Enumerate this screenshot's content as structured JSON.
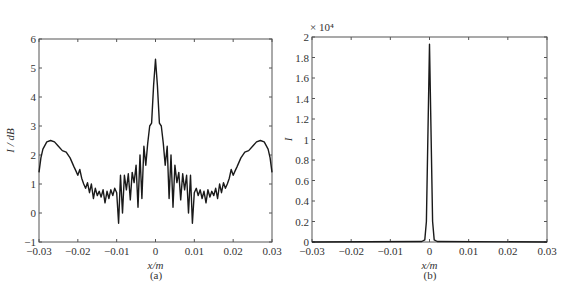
{
  "figure": {
    "caption_a": "(a)",
    "caption_b": "(b)"
  },
  "chart_data": [
    {
      "type": "line",
      "panel": "(a)",
      "xlabel": "x/m",
      "ylabel": "I / dB",
      "xlim": [
        -0.03,
        0.03
      ],
      "ylim": [
        -1,
        6
      ],
      "xticks": [
        -0.03,
        -0.02,
        -0.01,
        0,
        0.01,
        0.02,
        0.03
      ],
      "xtick_labels": [
        "−0.03",
        "−0.02",
        "−0.01",
        "0",
        "0.01",
        "0.02",
        "0.03"
      ],
      "yticks": [
        -1,
        0,
        1,
        2,
        3,
        4,
        5,
        6
      ],
      "ytick_labels": [
        "−1",
        "0",
        "1",
        "2",
        "3",
        "4",
        "5",
        "6"
      ],
      "grid": false,
      "symmetric": true,
      "series": [
        {
          "name": "I (dB)",
          "color": "#1a1a1a",
          "x": [
            -0.03,
            -0.0295,
            -0.029,
            -0.028,
            -0.027,
            -0.026,
            -0.025,
            -0.024,
            -0.023,
            -0.022,
            -0.021,
            -0.0205,
            -0.02,
            -0.0195,
            -0.019,
            -0.0185,
            -0.018,
            -0.0175,
            -0.017,
            -0.0165,
            -0.016,
            -0.0155,
            -0.015,
            -0.0145,
            -0.014,
            -0.0135,
            -0.013,
            -0.0125,
            -0.012,
            -0.0115,
            -0.011,
            -0.0105,
            -0.01,
            -0.0095,
            -0.009,
            -0.0085,
            -0.008,
            -0.0075,
            -0.007,
            -0.0065,
            -0.006,
            -0.0055,
            -0.005,
            -0.0045,
            -0.004,
            -0.0035,
            -0.003,
            -0.0025,
            -0.002,
            -0.0015,
            -0.001,
            -0.0005,
            0
          ],
          "y": [
            1.4,
            1.9,
            2.2,
            2.45,
            2.5,
            2.45,
            2.3,
            2.15,
            2.1,
            1.9,
            1.6,
            1.45,
            1.3,
            1.5,
            1.2,
            1.0,
            0.85,
            1.05,
            0.7,
            1.0,
            0.5,
            0.85,
            0.6,
            0.75,
            0.55,
            0.8,
            0.35,
            0.75,
            0.5,
            0.8,
            0.6,
            0.85,
            0.7,
            -0.35,
            1.3,
            0.0,
            1.3,
            0.8,
            1.35,
            0.45,
            1.4,
            1.05,
            1.65,
            0.2,
            2.0,
            0.5,
            2.3,
            1.65,
            2.4,
            3.0,
            3.1,
            4.4,
            5.3
          ]
        }
      ]
    },
    {
      "type": "line",
      "panel": "(b)",
      "xlabel": "x/m",
      "ylabel": "I",
      "y_multiplier": "× 10⁴",
      "xlim": [
        -0.03,
        0.03
      ],
      "ylim": [
        0,
        2
      ],
      "xticks": [
        -0.03,
        -0.02,
        -0.01,
        0,
        0.01,
        0.02,
        0.03
      ],
      "xtick_labels": [
        "−0.03",
        "−0.02",
        "−0.01",
        "0",
        "0.01",
        "0.02",
        "0.03"
      ],
      "yticks": [
        0,
        0.2,
        0.4,
        0.6,
        0.8,
        1,
        1.2,
        1.4,
        1.6,
        1.8,
        2
      ],
      "ytick_labels": [
        "0",
        "0.2",
        "0.4",
        "0.6",
        "0.8",
        "1",
        "1.2",
        "1.4",
        "1.6",
        "1.8",
        "2"
      ],
      "grid": false,
      "series": [
        {
          "name": "I",
          "color": "#1a1a1a",
          "x": [
            -0.03,
            -0.002,
            -0.0012,
            -0.0008,
            0,
            0.0008,
            0.0012,
            0.002,
            0.03
          ],
          "y": [
            0.0,
            0.005,
            0.02,
            0.2,
            1.93,
            0.2,
            0.02,
            0.005,
            0.0
          ]
        }
      ]
    }
  ]
}
